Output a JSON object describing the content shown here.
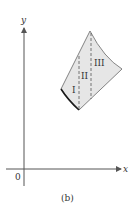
{
  "figure": {
    "caption": "(b)",
    "axes": {
      "x_label": "x",
      "y_label": "y",
      "origin_label": "0"
    },
    "regions": [
      {
        "label": "I"
      },
      {
        "label": "II"
      },
      {
        "label": "III"
      }
    ],
    "colors": {
      "region_fill": "#e6e6e6",
      "outline": "#555555",
      "boundary_curve": "#1a1a1a",
      "axis": "#555555"
    }
  }
}
